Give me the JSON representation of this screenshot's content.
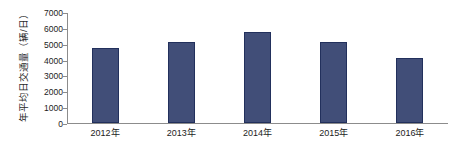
{
  "chart_data": {
    "type": "bar",
    "title": "",
    "subtitle": "",
    "xlabel": "",
    "ylabel": "年平均日交通量（辆/日）",
    "categories": [
      "2012年",
      "2013年",
      "2014年",
      "2015年",
      "2016年"
    ],
    "values": [
      4730,
      5080,
      5740,
      5110,
      4070
    ],
    "ylim": [
      0,
      7000
    ],
    "ytick_labels": [
      "0",
      "1000",
      "2000",
      "3000",
      "4000",
      "5000",
      "6000",
      "7000"
    ],
    "ytick_values": [
      0,
      1000,
      2000,
      3000,
      4000,
      5000,
      6000,
      7000
    ],
    "grid": false,
    "legend": false,
    "legend_position": "none",
    "bar_color": "#414E78",
    "bar_edge_color": "#22305C",
    "axis_color": "#8C8C8C",
    "background_color": "#FFFFFF"
  }
}
